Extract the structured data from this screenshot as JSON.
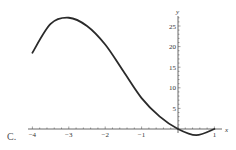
{
  "option_label": "C.",
  "chart_data": {
    "type": "line",
    "title": "",
    "xlabel": "x",
    "ylabel": "y",
    "xlim": [
      -4,
      1
    ],
    "ylim": [
      -2,
      28
    ],
    "grid": false,
    "x_ticks": [
      "-4",
      "-3",
      "-2",
      "-1",
      "1"
    ],
    "y_ticks": [
      "5",
      "10",
      "15",
      "20",
      "25"
    ],
    "series": [
      {
        "name": "curve",
        "x": [
          -4,
          -3.5,
          -3,
          -2.5,
          -2,
          -1.5,
          -1,
          -0.5,
          0,
          0.5,
          1
        ],
        "y": [
          18.5,
          25.5,
          27,
          25,
          20.5,
          14,
          7.5,
          3,
          0,
          -1.5,
          0
        ]
      }
    ],
    "line_color": "#2a2a2a"
  }
}
